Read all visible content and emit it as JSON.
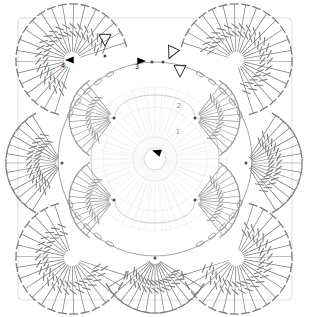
{
  "diagram": {
    "type": "crochet-symbol-chart",
    "background_color": "#ffffff",
    "rounds": [
      {
        "number": "1",
        "label_x": 176,
        "label_y": 128,
        "stroke": "#d9d9d9",
        "note": "innermost round, very faint"
      },
      {
        "number": "2",
        "label_x": 177,
        "label_y": 102,
        "stroke": "#c8c8c8",
        "note": "second round, faint"
      },
      {
        "number": "3",
        "label_x": 135,
        "label_y": 63,
        "stroke": "#9a9a9a",
        "note": "third round, medium grey"
      },
      {
        "number": "4",
        "label_x": 61,
        "label_y": 62,
        "stroke": "#777777",
        "note": "outer round, darkest"
      }
    ],
    "markers": {
      "start_arrow": {
        "name": "center-start-arrow",
        "x": 157,
        "y": 152,
        "rotation": -160,
        "fill": "#000000"
      },
      "round_arrows": [
        {
          "name": "round-4-arrow",
          "x": 70,
          "y": 60,
          "rotation": 180,
          "fill": "#000000"
        },
        {
          "name": "round-3-arrow",
          "x": 141,
          "y": 61,
          "rotation": 0,
          "fill": "#000000"
        }
      ],
      "hollow_triangles": [
        {
          "name": "join-marker-top",
          "x": 105,
          "y": 39,
          "rotation": 180,
          "stroke": "#2b2b2b"
        },
        {
          "name": "join-marker-right-upper",
          "x": 172,
          "y": 52,
          "rotation": 205,
          "stroke": "#2b2b2b"
        },
        {
          "name": "join-marker-right-lower",
          "x": 180,
          "y": 70,
          "rotation": 180,
          "stroke": "#2b2b2b"
        }
      ],
      "join_dots": [
        {
          "name": "join-dot",
          "x": 105,
          "y": 56
        },
        {
          "name": "join-dot",
          "x": 152,
          "y": 62
        },
        {
          "name": "join-dot",
          "x": 163,
          "y": 62
        },
        {
          "name": "join-dot",
          "x": 62,
          "y": 163
        },
        {
          "name": "join-dot",
          "x": 246,
          "y": 163
        },
        {
          "name": "join-dot",
          "x": 155,
          "y": 258
        },
        {
          "name": "join-dot",
          "x": 114,
          "y": 118
        },
        {
          "name": "join-dot",
          "x": 195,
          "y": 118
        },
        {
          "name": "join-dot",
          "x": 114,
          "y": 200
        },
        {
          "name": "join-dot",
          "x": 195,
          "y": 200
        }
      ]
    },
    "stitch_legend": [
      {
        "symbol": "double-treble",
        "glyph": "line-with-tee-and-two-slashes"
      },
      {
        "symbol": "treble",
        "glyph": "line-with-tee-and-one-slash"
      },
      {
        "symbol": "chain",
        "glyph": "oval"
      },
      {
        "symbol": "slip-stitch",
        "glyph": "dot"
      }
    ],
    "fans": [
      {
        "name": "fan-top-left",
        "cx": 72,
        "cy": 60,
        "r0": 8,
        "r1": 56,
        "a0": 108,
        "a1": 342,
        "n": 21,
        "stroke": "#7c7c7c"
      },
      {
        "name": "fan-top-right",
        "cx": 236,
        "cy": 60,
        "r0": 8,
        "r1": 56,
        "a0": 198,
        "a1": 432,
        "n": 21,
        "stroke": "#7c7c7c"
      },
      {
        "name": "fan-bottom-left",
        "cx": 72,
        "cy": 258,
        "r0": 8,
        "r1": 56,
        "a0": 18,
        "a1": 252,
        "n": 21,
        "stroke": "#7c7c7c"
      },
      {
        "name": "fan-bottom-right",
        "cx": 236,
        "cy": 258,
        "r0": 8,
        "r1": 56,
        "a0": 288,
        "a1": 522,
        "n": 21,
        "stroke": "#7c7c7c"
      },
      {
        "name": "fan-left",
        "cx": 62,
        "cy": 163,
        "r0": 6,
        "r1": 56,
        "a0": 122,
        "a1": 238,
        "n": 13,
        "stroke": "#7c7c7c"
      },
      {
        "name": "fan-right",
        "cx": 246,
        "cy": 163,
        "r0": 6,
        "r1": 56,
        "a0": -58,
        "a1": 58,
        "n": 13,
        "stroke": "#7c7c7c"
      },
      {
        "name": "fan-bottom",
        "cx": 155,
        "cy": 258,
        "r0": 6,
        "r1": 55,
        "a0": 32,
        "a1": 148,
        "n": 13,
        "stroke": "#7c7c7c"
      },
      {
        "name": "fan-inner-top-left",
        "cx": 114,
        "cy": 118,
        "r0": 5,
        "r1": 52,
        "a0": 128,
        "a1": 232,
        "n": 12,
        "stroke": "#9a9a9a"
      },
      {
        "name": "fan-inner-top-right",
        "cx": 195,
        "cy": 118,
        "r0": 5,
        "r1": 52,
        "a0": -52,
        "a1": 52,
        "n": 12,
        "stroke": "#9a9a9a"
      },
      {
        "name": "fan-inner-bottom-left",
        "cx": 114,
        "cy": 200,
        "r0": 5,
        "r1": 52,
        "a0": 128,
        "a1": 232,
        "n": 12,
        "stroke": "#9a9a9a"
      },
      {
        "name": "fan-inner-bottom-right",
        "cx": 195,
        "cy": 200,
        "r0": 5,
        "r1": 52,
        "a0": -52,
        "a1": 52,
        "n": 12,
        "stroke": "#9a9a9a"
      }
    ],
    "inner_fans": [
      {
        "name": "core-burst",
        "cx": 155,
        "cy": 159,
        "r0": 10,
        "r1": 74,
        "n": 56,
        "stroke": "#efefef"
      },
      {
        "name": "round2-burst-top",
        "cx": 155,
        "cy": 159,
        "r0": 26,
        "r1": 72,
        "n": 40,
        "stroke": "#ededed"
      }
    ],
    "rings": [
      {
        "name": "round-1-ring",
        "cx": 155,
        "cy": 159,
        "r": 22,
        "stroke": "#e2e2e2"
      },
      {
        "name": "round-2-ring",
        "cx": 155,
        "cy": 159,
        "r": 52,
        "stroke": "#ececec"
      },
      {
        "name": "round-3-ring",
        "cx": 155,
        "cy": 159,
        "r": 72,
        "stroke": "#eeeeee"
      },
      {
        "name": "center-ring",
        "cx": 155,
        "cy": 159,
        "r": 11,
        "stroke": "#d0d0d0"
      }
    ],
    "petal_path": {
      "name": "round-3-petal-outline",
      "stroke": "#b8b8b8",
      "d": "M155,95 C178,95 195,104 195,118 C209,118 219,136 219,159 C219,182 209,200 195,200 C195,214 178,223 155,223 C132,223 115,214 115,200 C101,200 91,182 91,159 C91,136 101,118 115,118 C115,104 132,95 155,95 Z"
    },
    "outer_square": {
      "name": "motif-outer-boundary",
      "stroke": "#cfcfcf",
      "x": 18,
      "y": 18,
      "w": 274,
      "h": 282
    },
    "round4_circle": {
      "name": "round-4-circle",
      "cx": 155,
      "cy": 159,
      "r": 97,
      "stroke": "#8c8c8c"
    }
  }
}
